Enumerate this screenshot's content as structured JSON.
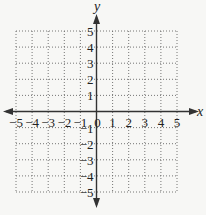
{
  "diagram": {
    "type": "coordinate-plane",
    "x_axis_label": "x",
    "y_axis_label": "y",
    "x_range": [
      -5,
      5
    ],
    "y_range": [
      -5,
      5
    ],
    "x_ticks": [
      "-5",
      "-4",
      "-3",
      "-2",
      "-1",
      "0",
      "1",
      "2",
      "3",
      "4",
      "5"
    ],
    "y_ticks_positive": [
      "5",
      "4",
      "3",
      "2",
      "1"
    ],
    "y_ticks_negative": [
      "-1",
      "-2",
      "-3",
      "-4",
      "-5"
    ],
    "grid": "dotted",
    "colors": {
      "background": "#f7f7f5",
      "axis": "#333333",
      "grid": "#666666",
      "text": "#222222"
    }
  }
}
